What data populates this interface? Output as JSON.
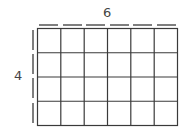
{
  "diagram": {
    "type": "area-grid",
    "columns": 6,
    "rows": 4,
    "width_label": "6",
    "height_label": "4",
    "line_color": "#3a3a3a",
    "dash_color": "#555555"
  }
}
